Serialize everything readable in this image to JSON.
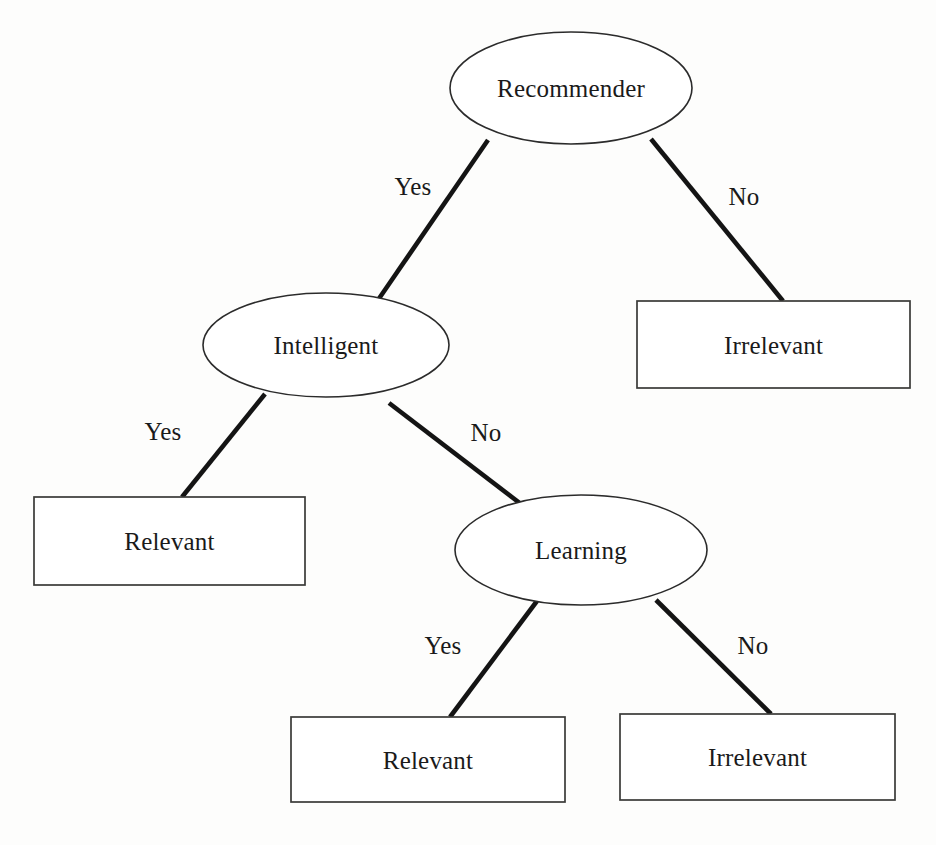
{
  "diagram": {
    "type": "decision-tree",
    "background_color": "#fdfdfc",
    "line_color": "#141414",
    "text_color": "#1a1a1a",
    "nodes": [
      {
        "id": "recommender",
        "label": "Recommender",
        "shape": "ellipse",
        "role": "decision",
        "cx": 571,
        "cy": 88,
        "rx": 121,
        "ry": 56
      },
      {
        "id": "intelligent",
        "label": "Intelligent",
        "shape": "ellipse",
        "role": "decision",
        "cx": 326,
        "cy": 345,
        "rx": 123,
        "ry": 52
      },
      {
        "id": "learning",
        "label": "Learning",
        "shape": "ellipse",
        "role": "decision",
        "cx": 581,
        "cy": 550,
        "rx": 126,
        "ry": 55
      },
      {
        "id": "irrelevant-top",
        "label": "Irrelevant",
        "shape": "rect",
        "role": "outcome",
        "x": 637,
        "y": 301,
        "width": 273,
        "height": 87
      },
      {
        "id": "relevant-left",
        "label": "Relevant",
        "shape": "rect",
        "role": "outcome",
        "x": 34,
        "y": 497,
        "width": 271,
        "height": 88
      },
      {
        "id": "relevant-bottom",
        "label": "Relevant",
        "shape": "rect",
        "role": "outcome",
        "x": 291,
        "y": 717,
        "width": 274,
        "height": 85
      },
      {
        "id": "irrelevant-bottom",
        "label": "Irrelevant",
        "shape": "rect",
        "role": "outcome",
        "x": 620,
        "y": 714,
        "width": 275,
        "height": 86
      }
    ],
    "edges": [
      {
        "id": "recommender-yes",
        "from": "recommender",
        "to": "intelligent",
        "label": "Yes",
        "x1": 488,
        "y1": 140,
        "x2": 378,
        "y2": 300,
        "label_x": 413,
        "label_y": 186
      },
      {
        "id": "recommender-no",
        "from": "recommender",
        "to": "irrelevant-top",
        "label": "No",
        "x1": 651,
        "y1": 139,
        "x2": 783,
        "y2": 301,
        "label_x": 744,
        "label_y": 196
      },
      {
        "id": "intelligent-yes",
        "from": "intelligent",
        "to": "relevant-left",
        "label": "Yes",
        "x1": 265,
        "y1": 394,
        "x2": 182,
        "y2": 497,
        "label_x": 163,
        "label_y": 431
      },
      {
        "id": "intelligent-no",
        "from": "intelligent",
        "to": "learning",
        "label": "No",
        "x1": 389,
        "y1": 403,
        "x2": 521,
        "y2": 504,
        "label_x": 486,
        "label_y": 432
      },
      {
        "id": "learning-yes",
        "from": "learning",
        "to": "relevant-bottom",
        "label": "Yes",
        "x1": 537,
        "y1": 601,
        "x2": 450,
        "y2": 717,
        "label_x": 443,
        "label_y": 645
      },
      {
        "id": "learning-no",
        "from": "learning",
        "to": "irrelevant-bottom",
        "label": "No",
        "x1": 656,
        "y1": 600,
        "x2": 771,
        "y2": 714,
        "label_x": 753,
        "label_y": 645
      }
    ]
  }
}
